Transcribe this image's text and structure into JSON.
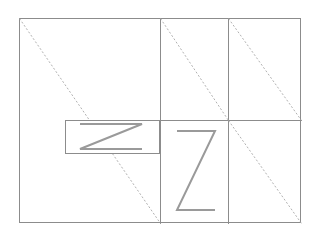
{
  "canvas": {
    "width": 320,
    "height": 236,
    "background_color": "#ffffff"
  },
  "style": {
    "solid_stroke_color": "#8c8c8c",
    "dashed_stroke_color": "#a8a8a8",
    "glyph_stroke_color": "#9a9a9a",
    "solid_stroke_width": 1,
    "dashed_stroke_width": 0.9,
    "glyph_stroke_width": 2,
    "dash_pattern": "2 2"
  },
  "figure": {
    "outer_rectangle": {
      "label": "outer-frame",
      "x": 19,
      "y": 18,
      "width": 282,
      "height": 205
    },
    "vertical_dividers": [
      {
        "label": "vertical-divider-left",
        "x": 160,
        "y1": 18,
        "y2": 223
      },
      {
        "label": "vertical-divider-right",
        "x": 228,
        "y1": 18,
        "y2": 223
      }
    ],
    "horizontal_dividers": [
      {
        "label": "horizontal-divider-mid",
        "y": 120,
        "x1": 160,
        "x2": 301
      }
    ],
    "diagonals": [
      {
        "label": "diagonal-main-left",
        "x1": 19,
        "y1": 18,
        "x2": 160,
        "y2": 223
      },
      {
        "label": "diagonal-top-middle",
        "x1": 160,
        "y1": 18,
        "x2": 228,
        "y2": 120
      },
      {
        "label": "diagonal-top-right",
        "x1": 228,
        "y1": 18,
        "x2": 301,
        "y2": 120
      },
      {
        "label": "diagonal-bottom-right",
        "x1": 228,
        "y1": 120,
        "x2": 301,
        "y2": 223
      }
    ],
    "inner_rectangle": {
      "label": "inner-panel",
      "x": 65,
      "y": 120,
      "width": 95,
      "height": 34
    },
    "glyphs": [
      {
        "label": "letter-z-small-rotated",
        "character": "Z",
        "rotation_degrees": 90,
        "bounds": {
          "x": 80,
          "y": 124,
          "width": 62,
          "height": 25
        }
      },
      {
        "label": "letter-z-large-upright",
        "character": "Z",
        "rotation_degrees": 0,
        "bounds": {
          "x": 176,
          "y": 130,
          "width": 40,
          "height": 82
        }
      }
    ]
  }
}
